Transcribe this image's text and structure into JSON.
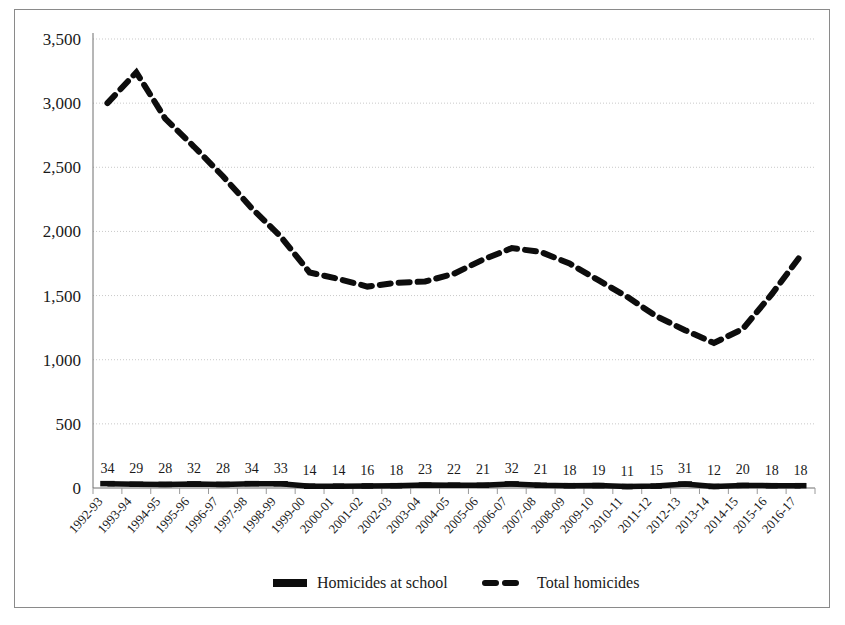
{
  "chart_data": {
    "type": "line",
    "title": "",
    "xlabel": "",
    "ylabel": "",
    "ylim": [
      0,
      3500
    ],
    "y_ticks": [
      "0",
      "500",
      "1,000",
      "1,500",
      "2,000",
      "2,500",
      "3,000",
      "3,500"
    ],
    "y_tick_values": [
      0,
      500,
      1000,
      1500,
      2000,
      2500,
      3000,
      3500
    ],
    "grid": true,
    "legend_position": "bottom",
    "categories": [
      "1992-93",
      "1993-94",
      "1994-95",
      "1995-96",
      "1996-97",
      "1997-98",
      "1998-99",
      "1999-00",
      "2000-01",
      "2001-02",
      "2002-03",
      "2003-04",
      "2004-05",
      "2005-06",
      "2006-07",
      "2007-08",
      "2008-09",
      "2009-10",
      "2010-11",
      "2011-12",
      "2012-13",
      "2013-14",
      "2014-15",
      "2015-16",
      "2016-17"
    ],
    "series": [
      {
        "name": "Homicides at school",
        "style": "solid",
        "labelled": true,
        "values": [
          34,
          29,
          28,
          32,
          28,
          34,
          33,
          14,
          14,
          16,
          18,
          23,
          22,
          21,
          32,
          21,
          18,
          19,
          11,
          15,
          31,
          12,
          20,
          18,
          18
        ]
      },
      {
        "name": "Total homicides",
        "style": "dashed",
        "labelled": false,
        "values": [
          3000,
          3240,
          2880,
          2660,
          2430,
          2180,
          1960,
          1680,
          1630,
          1570,
          1600,
          1610,
          1670,
          1780,
          1870,
          1840,
          1750,
          1620,
          1490,
          1340,
          1230,
          1130,
          1240,
          1510,
          1810
        ]
      }
    ],
    "legend": [
      {
        "label": "Homicides at school",
        "marker": "solid-bar"
      },
      {
        "label": "Total homicides",
        "marker": "dashed-bar"
      }
    ],
    "colors": {
      "series": "#0d0d0d",
      "grid": "#c9c9c9",
      "axis": "#6f6f6f",
      "frame": "#8a8a8a",
      "text": "#1a1a1a",
      "background": "#ffffff"
    }
  }
}
